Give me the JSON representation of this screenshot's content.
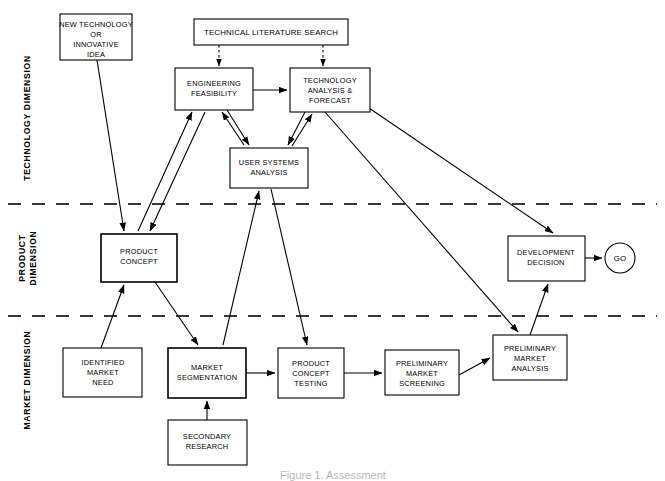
{
  "figure": {
    "caption": "Figure 1. Assessment",
    "background_color": "#ffffff",
    "line_color": "#000000",
    "divider_color": "#3a3a3a"
  },
  "dimensions": [
    {
      "id": "technology",
      "label": "TECHNOLOGY DIMENSION",
      "band_top": 0,
      "band_bottom": 204
    },
    {
      "id": "product",
      "label_line1": "PRODUCT",
      "label_line2": "DIMENSION",
      "band_top": 204,
      "band_bottom": 316
    },
    {
      "id": "market",
      "label": "MARKET DIMENSION",
      "band_top": 316,
      "band_bottom": 481
    }
  ],
  "dividers": [
    {
      "id": "technology-product-divider",
      "y": 204
    },
    {
      "id": "product-market-divider",
      "y": 316
    }
  ],
  "nodes": [
    {
      "id": "new-technology",
      "lines": [
        "NEW TECHNOLOGY",
        "OR",
        "INNOVATIVE",
        "IDEA"
      ],
      "x": 60,
      "y": 14,
      "w": 72,
      "h": 46,
      "shape": "rect",
      "dimension": "technology"
    },
    {
      "id": "technical-literature-search",
      "lines": [
        "TECHNICAL LITERATURE SEARCH"
      ],
      "x": 194,
      "y": 19,
      "w": 154,
      "h": 26,
      "shape": "rect",
      "dimension": "technology"
    },
    {
      "id": "engineering-feasibility",
      "lines": [
        "ENGINEERING",
        "FEASIBILITY"
      ],
      "x": 175,
      "y": 68,
      "w": 78,
      "h": 42,
      "shape": "rect",
      "dimension": "technology"
    },
    {
      "id": "technology-analysis-forecast",
      "lines": [
        "TECHNOLOGY",
        "ANALYSIS &",
        "FORECAST"
      ],
      "x": 290,
      "y": 68,
      "w": 80,
      "h": 44,
      "shape": "rect",
      "dimension": "technology"
    },
    {
      "id": "user-systems-analysis",
      "lines": [
        "USER SYSTEMS",
        "ANALYSIS"
      ],
      "x": 230,
      "y": 148,
      "w": 78,
      "h": 40,
      "shape": "rect",
      "dimension": "technology"
    },
    {
      "id": "product-concept",
      "lines": [
        "PRODUCT",
        "CONCEPT"
      ],
      "x": 101,
      "y": 234,
      "w": 76,
      "h": 48,
      "shape": "rect",
      "dimension": "product"
    },
    {
      "id": "development-decision",
      "lines": [
        "DEVELOPMENT",
        "DECISION"
      ],
      "x": 508,
      "y": 236,
      "w": 77,
      "h": 45,
      "shape": "rect",
      "dimension": "product"
    },
    {
      "id": "go",
      "lines": [
        "GO"
      ],
      "cx": 620,
      "cy": 258,
      "r": 15,
      "shape": "circle",
      "dimension": "product"
    },
    {
      "id": "identified-market-need",
      "lines": [
        "IDENTIFIED",
        "MARKET",
        "NEED"
      ],
      "x": 63,
      "y": 348,
      "w": 79,
      "h": 49,
      "shape": "rect",
      "dimension": "market"
    },
    {
      "id": "market-segmentation",
      "lines": [
        "MARKET",
        "SEGMENTATION"
      ],
      "x": 168,
      "y": 348,
      "w": 78,
      "h": 50,
      "shape": "rect",
      "dimension": "market"
    },
    {
      "id": "product-concept-testing",
      "lines": [
        "PRODUCT",
        "CONCEPT",
        "TESTING"
      ],
      "x": 278,
      "y": 348,
      "w": 66,
      "h": 50,
      "shape": "rect",
      "dimension": "market"
    },
    {
      "id": "preliminary-market-screening",
      "lines": [
        "PRELIMINARY",
        "MARKET",
        "SCREENING"
      ],
      "x": 385,
      "y": 350,
      "w": 74,
      "h": 45,
      "shape": "rect",
      "dimension": "market"
    },
    {
      "id": "preliminary-market-analysis",
      "lines": [
        "PRELIMINARY",
        "MARKET",
        "ANALYSIS"
      ],
      "x": 493,
      "y": 335,
      "w": 74,
      "h": 45,
      "shape": "rect",
      "dimension": "market"
    },
    {
      "id": "secondary-research",
      "lines": [
        "SECONDARY",
        "RESEARCH"
      ],
      "x": 168,
      "y": 420,
      "w": 79,
      "h": 45,
      "shape": "rect",
      "dimension": "market"
    }
  ],
  "edges": [
    {
      "id": "lit-search-to-engineering",
      "from": "technical-literature-search",
      "to": "engineering-feasibility",
      "style": "dashed"
    },
    {
      "id": "lit-search-to-tech-analysis",
      "from": "technical-literature-search",
      "to": "technology-analysis-forecast",
      "style": "dashed"
    },
    {
      "id": "new-technology-to-product-concept",
      "from": "new-technology",
      "to": "product-concept",
      "style": "solid"
    },
    {
      "id": "engineering-to-tech-analysis",
      "from": "engineering-feasibility",
      "to": "technology-analysis-forecast",
      "style": "solid"
    },
    {
      "id": "engineering-to-user-systems",
      "from": "engineering-feasibility",
      "to": "user-systems-analysis",
      "style": "solid"
    },
    {
      "id": "user-systems-to-engineering",
      "from": "user-systems-analysis",
      "to": "engineering-feasibility",
      "style": "solid"
    },
    {
      "id": "tech-analysis-to-user-systems",
      "from": "technology-analysis-forecast",
      "to": "user-systems-analysis",
      "style": "solid"
    },
    {
      "id": "user-systems-to-tech-analysis",
      "from": "user-systems-analysis",
      "to": "technology-analysis-forecast",
      "style": "solid"
    },
    {
      "id": "engineering-to-product-concept",
      "from": "engineering-feasibility",
      "to": "product-concept",
      "style": "solid"
    },
    {
      "id": "product-concept-to-engineering",
      "from": "product-concept",
      "to": "engineering-feasibility",
      "style": "solid"
    },
    {
      "id": "product-concept-to-market-segmentation",
      "from": "product-concept",
      "to": "market-segmentation",
      "style": "solid"
    },
    {
      "id": "identified-need-to-product-concept",
      "from": "identified-market-need",
      "to": "product-concept",
      "style": "solid"
    },
    {
      "id": "market-segmentation-to-user-systems",
      "from": "market-segmentation",
      "to": "user-systems-analysis",
      "style": "solid"
    },
    {
      "id": "user-systems-to-product-concept-testing",
      "from": "user-systems-analysis",
      "to": "product-concept-testing",
      "style": "solid"
    },
    {
      "id": "tech-analysis-to-preliminary-analysis",
      "from": "technology-analysis-forecast",
      "to": "preliminary-market-analysis",
      "style": "solid"
    },
    {
      "id": "tech-analysis-to-development-decision",
      "from": "technology-analysis-forecast",
      "to": "development-decision",
      "style": "solid"
    },
    {
      "id": "market-segmentation-to-concept-testing",
      "from": "market-segmentation",
      "to": "product-concept-testing",
      "style": "solid"
    },
    {
      "id": "secondary-research-to-market-segmentation",
      "from": "secondary-research",
      "to": "market-segmentation",
      "style": "solid"
    },
    {
      "id": "concept-testing-to-screening",
      "from": "product-concept-testing",
      "to": "preliminary-market-screening",
      "style": "solid"
    },
    {
      "id": "screening-to-preliminary-analysis",
      "from": "preliminary-market-screening",
      "to": "preliminary-market-analysis",
      "style": "solid"
    },
    {
      "id": "preliminary-analysis-to-development-decision",
      "from": "preliminary-market-analysis",
      "to": "development-decision",
      "style": "solid"
    },
    {
      "id": "development-decision-to-go",
      "from": "development-decision",
      "to": "go",
      "style": "solid"
    }
  ]
}
